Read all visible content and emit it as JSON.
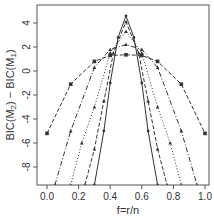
{
  "chart_data": {
    "type": "line",
    "title": "",
    "xlabel": "f=r/n",
    "ylabel": "BIC(M2) - BIC(M1)",
    "xlim": [
      0.0,
      1.0
    ],
    "ylim": [
      -9.5,
      5.5
    ],
    "xticks": [
      "0.0",
      "0.2",
      "0.4",
      "0.6",
      "0.8",
      "1.0"
    ],
    "yticks": [
      "-8",
      "-6",
      "-4",
      "-2",
      "0",
      "2",
      "4"
    ],
    "grid": false,
    "legend": null,
    "series": [
      {
        "name": "curve-1",
        "style": "dashed",
        "marker": "square",
        "x": [
          0.0,
          0.15,
          0.3,
          0.4,
          0.5,
          0.6,
          0.7,
          0.85,
          1.0
        ],
        "y": [
          -5.2,
          -1.1,
          0.8,
          1.3,
          1.35,
          1.3,
          0.8,
          -1.1,
          -5.2
        ]
      },
      {
        "name": "curve-2",
        "style": "dashdot",
        "marker": "triangle",
        "x": [
          0.05,
          0.15,
          0.3,
          0.4,
          0.5,
          0.6,
          0.7,
          0.85,
          0.95
        ],
        "y": [
          -9.5,
          -5.0,
          0.3,
          1.8,
          2.2,
          1.8,
          0.3,
          -5.0,
          -9.5
        ]
      },
      {
        "name": "curve-3",
        "style": "dotted",
        "marker": "triangle",
        "x": [
          0.15,
          0.22,
          0.3,
          0.4,
          0.5,
          0.6,
          0.7,
          0.78,
          0.85
        ],
        "y": [
          -9.5,
          -6.0,
          -3.0,
          1.5,
          3.3,
          1.5,
          -3.0,
          -6.0,
          -9.5
        ]
      },
      {
        "name": "curve-4",
        "style": "dashed",
        "marker": "triangle",
        "x": [
          0.24,
          0.3,
          0.36,
          0.42,
          0.5,
          0.58,
          0.64,
          0.7,
          0.76
        ],
        "y": [
          -9.5,
          -6.5,
          -2.5,
          1.5,
          4.1,
          1.5,
          -2.5,
          -6.5,
          -9.5
        ]
      },
      {
        "name": "curve-5",
        "style": "solid",
        "marker": "point",
        "x": [
          0.3,
          0.36,
          0.4,
          0.45,
          0.5,
          0.55,
          0.6,
          0.64,
          0.7
        ],
        "y": [
          -9.5,
          -5.0,
          -1.0,
          2.8,
          4.6,
          2.8,
          -1.0,
          -5.0,
          -9.5
        ]
      }
    ]
  },
  "axes": {
    "xlabel": "f=r/n",
    "ylabel_main": "BIC(M",
    "ylabel_sub2": "2",
    "ylabel_mid": ") − BIC(M",
    "ylabel_sub1": "1",
    "ylabel_end": ")",
    "xticks": [
      "0.0",
      "0.2",
      "0.4",
      "0.6",
      "0.8",
      "1.0"
    ],
    "yticks": [
      "4",
      "2",
      "0",
      "-2",
      "-4",
      "-6",
      "-8"
    ]
  }
}
